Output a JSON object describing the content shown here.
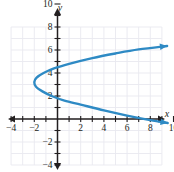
{
  "chart_data": {
    "type": "line",
    "title": "",
    "subtitle": "",
    "xlabel": "x",
    "ylabel": "y",
    "xlim": [
      -5,
      11
    ],
    "ylim": [
      -5,
      11
    ],
    "grid": true,
    "legend": null,
    "annotations": [],
    "x_ticks": [
      -4,
      -2,
      2,
      4,
      6,
      8,
      10
    ],
    "y_ticks": [
      -4,
      -2,
      2,
      4,
      6,
      8,
      10
    ],
    "x_tick_labels": [
      "-4",
      "-2",
      "2",
      "4",
      "6",
      "8",
      "10"
    ],
    "y_tick_labels": [
      "-4",
      "-2",
      "2",
      "4",
      "6",
      "8",
      "10"
    ],
    "tick_step": 1,
    "series": [
      {
        "name": "sideways parabola",
        "color": "#2e8ac4",
        "vertex": [
          -2,
          3
        ],
        "opens": "right",
        "arrow_start": true,
        "arrow_end": true,
        "y_intercepts": [
          1.7,
          4.2
        ],
        "points": [
          [
            9.5,
            -0.35
          ],
          [
            8,
            -0.1
          ],
          [
            6,
            0.3
          ],
          [
            4,
            0.75
          ],
          [
            2,
            1.25
          ],
          [
            0.6,
            1.6
          ],
          [
            -0.5,
            2.0
          ],
          [
            -1.3,
            2.4
          ],
          [
            -1.85,
            2.8
          ],
          [
            -2.0,
            3.2
          ],
          [
            -1.8,
            3.6
          ],
          [
            -1.2,
            4.0
          ],
          [
            -0.3,
            4.4
          ],
          [
            1,
            4.8
          ],
          [
            3,
            5.3
          ],
          [
            5,
            5.7
          ],
          [
            7,
            6.05
          ],
          [
            9.45,
            6.35
          ]
        ]
      }
    ],
    "colors": {
      "curve": "#2e8ac4",
      "axis": "#231f20",
      "grid": "#e9e9ef",
      "background": "#ffffff",
      "label": "#231f20"
    },
    "grid_extent": {
      "x_min_unit": -4.0,
      "x_max_unit": 9.0,
      "y_min_unit": -4.0,
      "y_max_unit": 8.0
    },
    "axes": {
      "x_axis_arrow_left": true,
      "x_axis_arrow_right": true,
      "y_axis_arrow_up": true,
      "y_axis_arrow_down": true
    }
  }
}
